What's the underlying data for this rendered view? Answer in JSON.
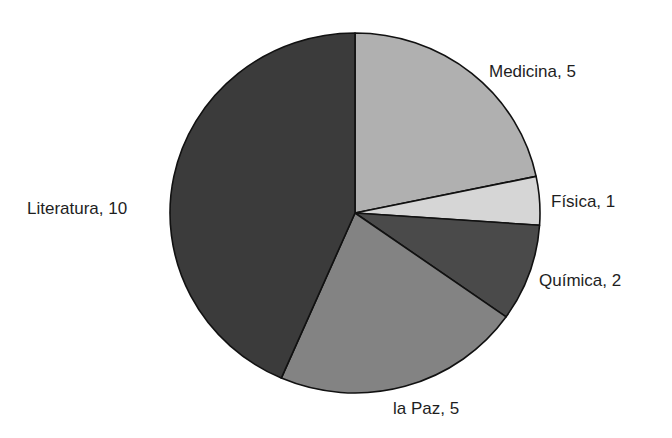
{
  "chart_data": {
    "type": "pie",
    "title": "",
    "categories": [
      "Medicina",
      "Física",
      "Química",
      "la Paz",
      "Literatura"
    ],
    "values": [
      5,
      1,
      2,
      5,
      10
    ],
    "total": 23,
    "start_angle": "12 o'clock",
    "direction": "clockwise",
    "colors": [
      "#b0b0b0",
      "#d6d6d6",
      "#4a4a4a",
      "#838383",
      "#3b3b3b"
    ],
    "labels": [
      "Medicina, 5",
      "Física, 1",
      "Química, 2",
      "la Paz, 5",
      "Literatura, 10"
    ],
    "legend": "none (direct labels)"
  },
  "labels": {
    "medicina": "Medicina, 5",
    "fisica": "Física, 1",
    "quimica": "Química, 2",
    "paz": "la Paz, 5",
    "literatura": "Literatura, 10"
  }
}
